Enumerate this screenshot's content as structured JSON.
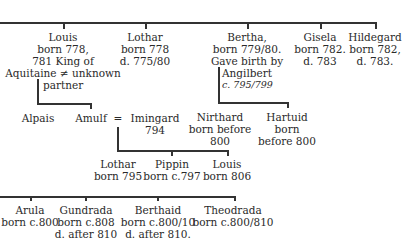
{
  "tree": {
    "children_of_charlemagne": [
      {
        "id": "louis",
        "lines": [
          "Louis",
          "born 778,",
          "781 King of",
          "Aquitaine ≠ unknown",
          "partner"
        ]
      },
      {
        "id": "lothar",
        "lines": [
          "Lothar",
          "born 778",
          "d. 775/80"
        ]
      },
      {
        "id": "bertha",
        "lines": [
          "Bertha,",
          "born 779/80.",
          "Gave birth by"
        ]
      },
      {
        "id": "gisela",
        "lines": [
          "Gisela",
          "born 782.",
          "d. 783"
        ]
      },
      {
        "id": "hildegard",
        "lines": [
          "Hildegard",
          "born 782,",
          "d. 783."
        ]
      }
    ],
    "angilbert": {
      "lines": [
        "Angilbert",
        "c. 795/799"
      ]
    },
    "louis_children": [
      {
        "id": "alpais",
        "lines": [
          "Alpais"
        ]
      },
      {
        "id": "amulf",
        "lines": [
          "Amulf"
        ]
      }
    ],
    "marriage_sign": "=",
    "imingard": {
      "lines": [
        "Imingard",
        "794"
      ]
    },
    "bertha_children": [
      {
        "id": "nirthard",
        "lines": [
          "Nirthard",
          "born before",
          "800"
        ]
      },
      {
        "id": "hartuid",
        "lines": [
          "Hartuid",
          "born",
          "before 800"
        ]
      }
    ],
    "amulf_children": [
      {
        "id": "lothar2",
        "lines": [
          "Lothar",
          "born 795"
        ]
      },
      {
        "id": "pippin",
        "lines": [
          "Pippin",
          "born c.797"
        ]
      },
      {
        "id": "louis2",
        "lines": [
          "Louis",
          "born 806"
        ]
      }
    ],
    "bottom_row": [
      {
        "id": "arula",
        "lines": [
          "Arula",
          "born c.800"
        ]
      },
      {
        "id": "gundrada",
        "lines": [
          "Gundrada",
          "born c.808",
          "d. after 810"
        ]
      },
      {
        "id": "berthaid",
        "lines": [
          "Berthaid",
          "born c.800/10",
          "d. after 810."
        ]
      },
      {
        "id": "theodrada",
        "lines": [
          "Theodrada",
          "born c.800/810"
        ]
      }
    ]
  }
}
